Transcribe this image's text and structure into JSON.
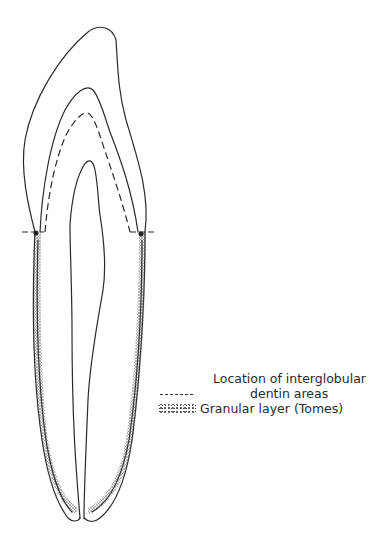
{
  "figure": {
    "line_color": "#2a2a2a",
    "background": "#ffffff"
  },
  "legend": {
    "items": [
      {
        "symbol": "dashed-line",
        "label_line1": "Location of interglobular",
        "label_line2": "dentin areas"
      },
      {
        "symbol": "stippled-texture",
        "label": "Granular layer (Tomes)"
      }
    ]
  }
}
